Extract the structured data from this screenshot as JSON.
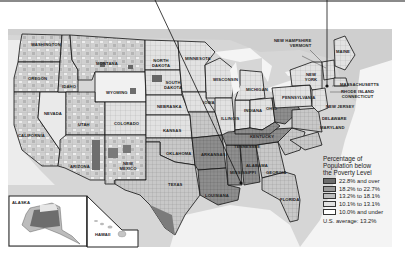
{
  "figure": {
    "type": "choropleth-map"
  },
  "legend": {
    "title": "Percentage of Population below the Poverty Level",
    "title_lines": [
      "Percentage of",
      "Population below",
      "the Poverty Level"
    ],
    "items": [
      {
        "label": "22.8% and over",
        "color": "#6b6b6b"
      },
      {
        "label": "18.2% to 22.7%",
        "color": "#9a9a9a"
      },
      {
        "label": "13.2% to 18.1%",
        "color": "#bdbdbd"
      },
      {
        "label": "10.1% to 13.1%",
        "color": "#e1e1e1"
      },
      {
        "label": "10.0% and under",
        "color": "#ffffff"
      }
    ],
    "average": "U.S. average:  13.2%"
  },
  "state_labels": [
    {
      "name": "Washington",
      "x": 33,
      "y": 44
    },
    {
      "name": "Oregon",
      "x": 30,
      "y": 78
    },
    {
      "name": "California",
      "x": 22,
      "y": 135
    },
    {
      "name": "Nevada",
      "x": 48,
      "y": 113
    },
    {
      "name": "Idaho",
      "x": 66,
      "y": 85
    },
    {
      "name": "Montana",
      "x": 96,
      "y": 63
    },
    {
      "name": "Wyoming",
      "x": 108,
      "y": 90
    },
    {
      "name": "Utah",
      "x": 79,
      "y": 123
    },
    {
      "name": "Colorado",
      "x": 114,
      "y": 122
    },
    {
      "name": "Arizona",
      "x": 70,
      "y": 166
    },
    {
      "name": "New Mexico",
      "x": 119,
      "y": 165
    },
    {
      "name": "North Dakota",
      "x": 149,
      "y": 63
    },
    {
      "name": "South Dakota",
      "x": 164,
      "y": 85
    },
    {
      "name": "Nebraska",
      "x": 157,
      "y": 106
    },
    {
      "name": "Kansas",
      "x": 165,
      "y": 130
    },
    {
      "name": "Minnesota",
      "x": 185,
      "y": 58
    },
    {
      "name": "Wisconsin",
      "x": 216,
      "y": 78
    },
    {
      "name": "Iowa",
      "x": 204,
      "y": 100
    },
    {
      "name": "Illinois",
      "x": 224,
      "y": 115
    },
    {
      "name": "Michigan",
      "x": 250,
      "y": 88
    },
    {
      "name": "Indiana",
      "x": 246,
      "y": 109
    },
    {
      "name": "Ohio",
      "x": 268,
      "y": 108
    },
    {
      "name": "Oklahoma",
      "x": 172,
      "y": 152
    },
    {
      "name": "Texas",
      "x": 172,
      "y": 183
    },
    {
      "name": "Arkansas",
      "x": 207,
      "y": 152
    },
    {
      "name": "Louisiana",
      "x": 212,
      "y": 194
    },
    {
      "name": "Mississippi",
      "x": 232,
      "y": 172
    },
    {
      "name": "Alabama",
      "x": 250,
      "y": 165
    },
    {
      "name": "Tennessee",
      "x": 244,
      "y": 146
    },
    {
      "name": "Kentucky",
      "x": 257,
      "y": 136
    },
    {
      "name": "Georgia",
      "x": 270,
      "y": 172
    },
    {
      "name": "Florida",
      "x": 284,
      "y": 196
    },
    {
      "name": "New York",
      "x": 305,
      "y": 76
    },
    {
      "name": "Pennsylvania",
      "x": 289,
      "y": 96
    },
    {
      "name": "Maine",
      "x": 336,
      "y": 50
    },
    {
      "name": "Alaska",
      "x": 11,
      "y": 204
    },
    {
      "name": "Hawaii",
      "x": 95,
      "y": 232
    }
  ],
  "callouts": {
    "new_hampshire_vermont": [
      "NEW HAMPSHIRE",
      "VERMONT"
    ],
    "massachusetts": "MASSACHUSETTS",
    "rhode_island_connecticut": [
      "RHODE ISLAND",
      "CONNECTICUT"
    ],
    "new_jersey": "NEW JERSEY",
    "delaware": "DELAWARE",
    "maryland": "MARYLAND"
  },
  "insets": {
    "alaska_label": "ALASKA",
    "hawaii_label": "HAWAII"
  }
}
